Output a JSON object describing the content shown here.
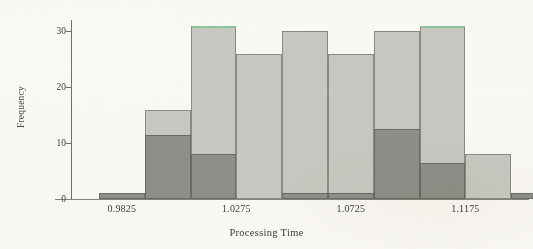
{
  "chart_data": {
    "type": "bar",
    "title": "",
    "subtitle": "",
    "xlabel": "Processing Time",
    "ylabel": "Frequency",
    "ylim": [
      0,
      32
    ],
    "xlim": [
      0.9625,
      1.1425
    ],
    "grid": false,
    "legend": "none",
    "bin_width": 0.018,
    "bin_edges": [
      0.9735,
      0.9915,
      1.0095,
      1.0275,
      1.0455,
      1.0635,
      1.0815,
      1.0995,
      1.1175,
      1.1355,
      1.1445
    ],
    "categories": [
      "bin1",
      "bin2",
      "bin3",
      "bin4",
      "bin5",
      "bin6",
      "bin7",
      "bin8",
      "bin9",
      "bin10"
    ],
    "series": [
      {
        "name": "light-series",
        "color": "#c9cac5",
        "values": [
          1,
          16,
          31,
          26,
          30,
          26,
          30,
          31,
          8,
          1
        ]
      },
      {
        "name": "dark-series",
        "color": "#8e918b",
        "values": [
          1,
          11.5,
          8,
          0,
          1,
          1,
          12.5,
          6.5,
          0,
          1
        ]
      }
    ],
    "highlight": {
      "color": "#8fc79a",
      "note": "green top edge on bars reaching 31",
      "bins": [
        3,
        8
      ]
    },
    "yticks": [
      {
        "value": 0,
        "label": "0"
      },
      {
        "value": 10,
        "label": "10"
      },
      {
        "value": 20,
        "label": "20"
      },
      {
        "value": 30,
        "label": "30"
      }
    ],
    "xticks": [
      {
        "value": 0.9825,
        "label": "0.9825"
      },
      {
        "value": 1.0275,
        "label": "1.0275"
      },
      {
        "value": 1.0725,
        "label": "1.0725"
      },
      {
        "value": 1.1175,
        "label": "1.1175"
      }
    ]
  }
}
